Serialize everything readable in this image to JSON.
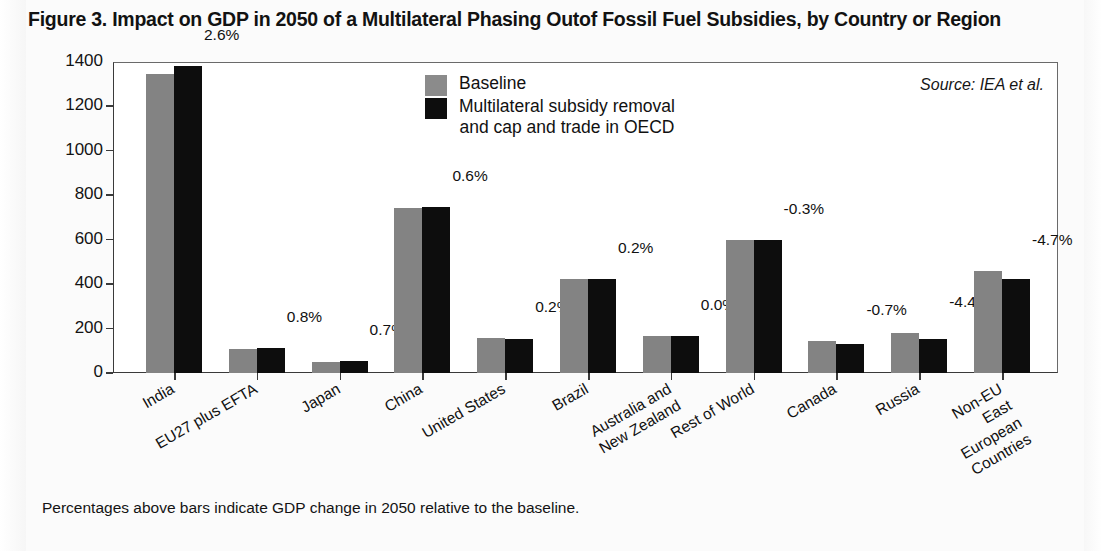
{
  "figure": {
    "title": "Figure 3. Impact on GDP in 2050 of a Multilateral Phasing Outof Fossil Fuel Subsidies, by Country or Region",
    "source_note": "Source: IEA et al.",
    "footnote": "Percentages above bars indicate GDP change in 2050 relative to the baseline."
  },
  "legend": {
    "position": "inside-top-center",
    "items": [
      {
        "label": "Baseline",
        "color": "#8b8b8b"
      },
      {
        "label": "Multilateral subsidy removal\nand cap and trade in OECD",
        "color": "#0d0d0d"
      }
    ]
  },
  "chart_data": {
    "type": "bar",
    "title": "Figure 3. Impact on GDP in 2050 of a Multilateral Phasing Outof Fossil Fuel Subsidies, by Country or Region",
    "xlabel": "",
    "ylabel": "Projected GDP Growth (%)",
    "ylim": [
      0,
      1400
    ],
    "yticks": [
      0,
      200,
      400,
      600,
      800,
      1000,
      1200,
      1400
    ],
    "ytick_labels": [
      "0",
      "200",
      "400",
      "600",
      "800",
      "1000",
      "1200",
      "1400"
    ],
    "grid": false,
    "legend_position": "upper center",
    "categories": [
      "India",
      "EU27 plus EFTA",
      "Japan",
      "China",
      "United States",
      "Brazil",
      "Australia and\nNew Zealand",
      "Rest of World",
      "Canada",
      "Russia",
      "Non-EU East\nEuropean Countries"
    ],
    "series": [
      {
        "name": "Baseline",
        "color": "#838383",
        "values": [
          1348,
          110,
          50,
          745,
          158,
          425,
          168,
          600,
          145,
          182,
          458
        ]
      },
      {
        "name": "Multilateral subsidy removal and cap and trade in OECD",
        "color": "#0d0d0d",
        "values": [
          1383,
          112,
          52,
          748,
          155,
          425,
          168,
          598,
          130,
          155,
          425
        ]
      }
    ],
    "annotations": {
      "label": "GDP change in 2050 relative to the baseline",
      "values": [
        "2.6%",
        "0.8%",
        "0.7%",
        "0.6%",
        "0.2%",
        "0.2%",
        "0.0%",
        "-0.3%",
        "-0.7%",
        "-4.4%",
        "-4.7%"
      ]
    }
  }
}
